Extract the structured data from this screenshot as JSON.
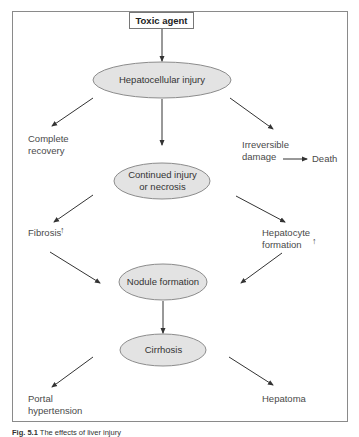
{
  "diagram": {
    "title_box": "Toxic agent",
    "nodes": {
      "hepatocellular_injury": "Hepatocellular injury",
      "continued_injury_line1": "Continued injury",
      "continued_injury_line2": "or necrosis",
      "nodule_formation": "Nodule formation",
      "cirrhosis": "Cirrhosis"
    },
    "outcomes": {
      "complete_recovery_line1": "Complete",
      "complete_recovery_line2": "recovery",
      "irreversible_damage_line1": "Irreversible",
      "irreversible_damage_line2": "damage",
      "death": "Death",
      "fibrosis": "Fibrosis",
      "hepatocyte_formation_line1": "Hepatocyte",
      "hepatocyte_formation_line2": "formation",
      "portal_hypertension_line1": "Portal",
      "portal_hypertension_line2": "hypertension",
      "hepatoma": "Hepatoma"
    },
    "increase_marker": "↑",
    "colors": {
      "ellipse_fill": "#e3e3e3",
      "ellipse_stroke": "#8c8c8c",
      "arrow": "#333333",
      "frame": "#8a8a8a"
    }
  },
  "caption": {
    "label": "Fig. 5.1",
    "text": "The effects of liver injury"
  }
}
